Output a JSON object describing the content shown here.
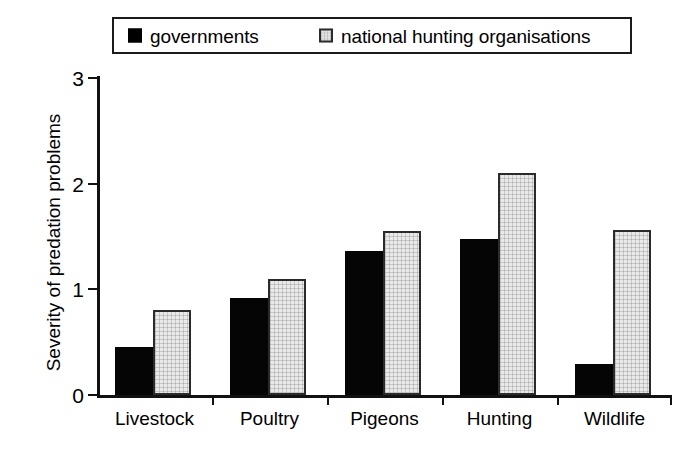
{
  "chart_data": {
    "type": "bar",
    "title": "",
    "xlabel": "",
    "ylabel": "Severity of predation problems",
    "categories": [
      "Livestock",
      "Poultry",
      "Pigeons",
      "Hunting",
      "Wildlife"
    ],
    "series": [
      {
        "name": "governments",
        "color": "#000000",
        "swatch": "filled-black-square",
        "values": [
          0.45,
          0.92,
          1.36,
          1.48,
          0.29
        ]
      },
      {
        "name": "national hunting organisations",
        "color": "#e9e9e9",
        "swatch": "hatched-light-square",
        "values": [
          0.8,
          1.1,
          1.55,
          2.1,
          1.56
        ]
      }
    ],
    "ylim": [
      0,
      3
    ],
    "yticks": [
      0,
      1,
      2,
      3
    ],
    "ytick_labels": [
      "0",
      "1",
      "2",
      "3"
    ],
    "grid": false,
    "legend_position": "top"
  },
  "legend": {
    "entries": [
      {
        "label": "governments"
      },
      {
        "label": "national hunting organisations"
      }
    ]
  },
  "axis": {
    "y_title": "Severity of predation problems"
  }
}
